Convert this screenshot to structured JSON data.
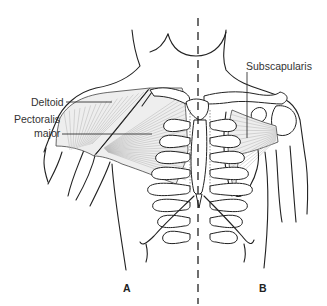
{
  "figure": {
    "panels": [
      {
        "id": "A",
        "label": "A",
        "side": "left",
        "view": "superficial"
      },
      {
        "id": "B",
        "label": "B",
        "side": "right",
        "view": "deep"
      }
    ],
    "labels": {
      "deltoid": "Deltoid",
      "pectoralis_line1": "Pectoralis",
      "pectoralis_line2": "major",
      "subscapularis": "Subscapularis"
    },
    "divider": "dashed-midline",
    "colors": {
      "line": "#222222",
      "muscle_fill": "#eeeeee",
      "fiber": "#b5b5b5",
      "text": "#333333",
      "background": "#ffffff"
    }
  }
}
